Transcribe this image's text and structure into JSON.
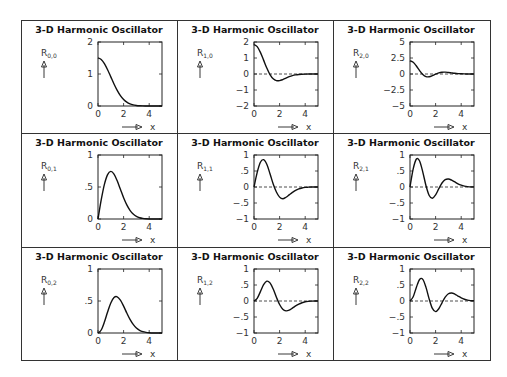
{
  "page": {
    "background": "#ffffff",
    "line_color": "#222222"
  },
  "grid": {
    "rows": 3,
    "cols": 3
  },
  "chart_data": [
    {
      "type": "line",
      "panel": "R_{0,0}",
      "title": "3-D Harmonic Oscillator",
      "ylabel": "R",
      "ysub": "0,0",
      "xlabel": "x",
      "ylim": [
        0,
        2
      ],
      "yticks": [
        0,
        1,
        2
      ],
      "ytick_labels": [
        "0",
        "1",
        "2"
      ],
      "xlim": [
        0,
        5
      ],
      "xticks": [
        0,
        2,
        4
      ],
      "xtick_labels": [
        "0",
        "2",
        "4"
      ],
      "zero_line": false,
      "x": [
        0,
        0.25,
        0.5,
        0.75,
        1,
        1.25,
        1.5,
        1.75,
        2,
        2.25,
        2.5,
        2.75,
        3,
        3.25,
        3.5,
        3.75,
        4,
        4.25,
        4.5,
        4.75,
        5
      ],
      "values": [
        1.502,
        1.456,
        1.326,
        1.134,
        0.911,
        0.688,
        0.488,
        0.325,
        0.203,
        0.12,
        0.066,
        0.034,
        0.017,
        0.008,
        0.003,
        0.001,
        0,
        0,
        0,
        0,
        0
      ]
    },
    {
      "type": "line",
      "panel": "R_{1,0}",
      "title": "3-D Harmonic Oscillator",
      "ylabel": "R",
      "ysub": "1,0",
      "xlabel": "x",
      "ylim": [
        -2,
        2
      ],
      "yticks": [
        -2,
        -1,
        0,
        1,
        2
      ],
      "ytick_labels": [
        "−2",
        "−1",
        "0",
        "1",
        "2"
      ],
      "xlim": [
        0,
        5
      ],
      "xticks": [
        0,
        2,
        4
      ],
      "xtick_labels": [
        "0",
        "2",
        "4"
      ],
      "zero_line": true,
      "x": [
        0,
        0.25,
        0.5,
        0.75,
        1,
        1.25,
        1.5,
        1.75,
        2,
        2.25,
        2.5,
        2.75,
        3,
        3.25,
        3.5,
        3.75,
        4,
        4.25,
        4.5,
        4.75,
        5
      ],
      "values": [
        1.84,
        1.708,
        1.353,
        0.868,
        0.372,
        -0.035,
        -0.299,
        -0.415,
        -0.415,
        -0.347,
        -0.256,
        -0.17,
        -0.102,
        -0.057,
        -0.029,
        -0.014,
        -0.006,
        0,
        0,
        0,
        0
      ]
    },
    {
      "type": "line",
      "panel": "R_{2,0}",
      "title": "3-D Harmonic Oscillator",
      "ylabel": "R",
      "ysub": "2,0",
      "xlabel": "x",
      "ylim": [
        -5,
        5
      ],
      "yticks": [
        -5,
        -2.5,
        0,
        2.5,
        5
      ],
      "ytick_labels": [
        "−5",
        "−2.5",
        "0",
        "2.5",
        "5"
      ],
      "xlim": [
        0,
        5
      ],
      "xticks": [
        0,
        2,
        4
      ],
      "xtick_labels": [
        "0",
        "2",
        "4"
      ],
      "zero_line": true,
      "x": [
        0,
        0.25,
        0.5,
        0.75,
        1,
        1.25,
        1.5,
        1.75,
        2,
        2.25,
        2.5,
        2.75,
        3,
        3.25,
        3.5,
        3.75,
        4,
        4.25,
        4.5,
        4.75,
        5
      ],
      "values": [
        2.063,
        1.834,
        1.244,
        0.521,
        -0.083,
        -0.408,
        -0.435,
        -0.26,
        -0.019,
        0.178,
        0.279,
        0.29,
        0.243,
        0.175,
        0.112,
        0.065,
        0.033,
        0.015,
        0.006,
        0.002,
        0
      ]
    },
    {
      "type": "line",
      "panel": "R_{0,1}",
      "title": "3-D Harmonic Oscillator",
      "ylabel": "R",
      "ysub": "0,1",
      "xlabel": "x",
      "ylim": [
        0,
        1
      ],
      "yticks": [
        0,
        0.5,
        1
      ],
      "ytick_labels": [
        "0",
        ".5",
        "1"
      ],
      "xlim": [
        0,
        5
      ],
      "xticks": [
        0,
        2,
        4
      ],
      "xtick_labels": [
        "0",
        "2",
        "4"
      ],
      "zero_line": false,
      "x": [
        0,
        0.25,
        0.5,
        0.75,
        1,
        1.25,
        1.5,
        1.75,
        2,
        2.25,
        2.5,
        2.75,
        3,
        3.25,
        3.5,
        3.75,
        4,
        4.25,
        4.5,
        4.75,
        5
      ],
      "values": [
        0,
        0.297,
        0.541,
        0.694,
        0.744,
        0.702,
        0.597,
        0.464,
        0.332,
        0.22,
        0.135,
        0.077,
        0.041,
        0.02,
        0.009,
        0.004,
        0.001,
        0,
        0,
        0,
        0
      ]
    },
    {
      "type": "line",
      "panel": "R_{1,1}",
      "title": "3-D Harmonic Oscillator",
      "ylabel": "R",
      "ysub": "1,1",
      "xlabel": "x",
      "ylim": [
        -1,
        1
      ],
      "yticks": [
        -1,
        -0.5,
        0,
        0.5,
        1
      ],
      "ytick_labels": [
        "−1",
        "−.5",
        "0",
        ".5",
        "1"
      ],
      "xlim": [
        0,
        5
      ],
      "xticks": [
        0,
        2,
        4
      ],
      "xtick_labels": [
        "0",
        "2",
        "4"
      ],
      "zero_line": true,
      "x": [
        0,
        0.25,
        0.5,
        0.75,
        1,
        1.25,
        1.5,
        1.75,
        2,
        2.25,
        2.5,
        2.75,
        3,
        3.25,
        3.5,
        3.75,
        4,
        4.25,
        4.5,
        4.75,
        5
      ],
      "values": [
        0,
        0.457,
        0.774,
        0.854,
        0.71,
        0.414,
        0.095,
        -0.156,
        -0.317,
        -0.369,
        -0.321,
        -0.245,
        -0.169,
        -0.104,
        -0.059,
        -0.03,
        -0.013,
        -0.005,
        0,
        0,
        0
      ]
    },
    {
      "type": "line",
      "panel": "R_{2,1}",
      "title": "3-D Harmonic Oscillator",
      "ylabel": "R",
      "ysub": "2,1",
      "xlabel": "x",
      "ylim": [
        -1,
        1
      ],
      "yticks": [
        -1,
        -0.5,
        0,
        0.5,
        1
      ],
      "ytick_labels": [
        "−1",
        "−.5",
        "0",
        ".5",
        "1"
      ],
      "xlim": [
        0,
        5
      ],
      "xticks": [
        0,
        2,
        4
      ],
      "xtick_labels": [
        "0",
        "2",
        "4"
      ],
      "zero_line": true,
      "x": [
        0,
        0.25,
        0.5,
        0.75,
        1,
        1.25,
        1.5,
        1.75,
        2,
        2.25,
        2.5,
        2.75,
        3,
        3.25,
        3.5,
        3.75,
        4,
        4.25,
        4.5,
        4.75,
        5
      ],
      "values": [
        0,
        0.564,
        0.873,
        0.813,
        0.467,
        0.041,
        -0.264,
        -0.351,
        -0.246,
        -0.053,
        0.125,
        0.228,
        0.249,
        0.215,
        0.158,
        0.1,
        0.057,
        0.029,
        0.013,
        0.005,
        0.002
      ]
    },
    {
      "type": "line",
      "panel": "R_{0,2}",
      "title": "3-D Harmonic Oscillator",
      "ylabel": "R",
      "ysub": "0,2",
      "xlabel": "x",
      "ylim": [
        0,
        1
      ],
      "yticks": [
        0,
        0.5,
        1
      ],
      "ytick_labels": [
        "0",
        ".5",
        "1"
      ],
      "xlim": [
        0,
        5
      ],
      "xticks": [
        0,
        2,
        4
      ],
      "xtick_labels": [
        "0",
        "2",
        "4"
      ],
      "zero_line": false,
      "x": [
        0,
        0.25,
        0.5,
        0.75,
        1,
        1.25,
        1.5,
        1.75,
        2,
        2.25,
        2.5,
        2.75,
        3,
        3.25,
        3.5,
        3.75,
        4,
        4.25,
        4.5,
        4.75,
        5
      ],
      "values": [
        0,
        0.047,
        0.171,
        0.329,
        0.47,
        0.554,
        0.566,
        0.513,
        0.42,
        0.312,
        0.213,
        0.134,
        0.077,
        0.042,
        0.021,
        0.01,
        0.004,
        0,
        0,
        0,
        0
      ]
    },
    {
      "type": "line",
      "panel": "R_{1,2}",
      "title": "3-D Harmonic Oscillator",
      "ylabel": "R",
      "ysub": "1,2",
      "xlabel": "x",
      "ylim": [
        -1,
        1
      ],
      "yticks": [
        -1,
        -0.5,
        0,
        0.5,
        1
      ],
      "ytick_labels": [
        "−1",
        "−.5",
        "0",
        ".5",
        "1"
      ],
      "xlim": [
        0,
        5
      ],
      "xticks": [
        0,
        2,
        4
      ],
      "xtick_labels": [
        "0",
        "2",
        "4"
      ],
      "zero_line": true,
      "x": [
        0,
        0.25,
        0.5,
        0.75,
        1,
        1.25,
        1.5,
        1.75,
        2,
        2.25,
        2.5,
        2.75,
        3,
        3.25,
        3.5,
        3.75,
        4,
        4.25,
        4.5,
        4.75,
        5
      ],
      "values": [
        0,
        0.085,
        0.292,
        0.509,
        0.619,
        0.566,
        0.373,
        0.118,
        -0.11,
        -0.257,
        -0.307,
        -0.286,
        -0.224,
        -0.155,
        -0.097,
        -0.054,
        -0.024,
        -0.01,
        -0.003,
        0,
        0
      ]
    },
    {
      "type": "line",
      "panel": "R_{2,2}",
      "title": "3-D Harmonic Oscillator",
      "ylabel": "R",
      "ysub": "2,2",
      "xlabel": "x",
      "ylim": [
        -1,
        1
      ],
      "yticks": [
        -1,
        -0.5,
        0,
        0.5,
        1
      ],
      "ytick_labels": [
        "−1",
        "−.5",
        "0",
        ".5",
        "1"
      ],
      "xlim": [
        0,
        5
      ],
      "xticks": [
        0,
        2,
        4
      ],
      "xtick_labels": [
        "0",
        "2",
        "4"
      ],
      "zero_line": true,
      "x": [
        0,
        0.25,
        0.5,
        0.75,
        1,
        1.25,
        1.5,
        1.75,
        2,
        2.25,
        2.5,
        2.75,
        3,
        3.25,
        3.5,
        3.75,
        4,
        4.25,
        4.5,
        4.75,
        5
      ],
      "values": [
        0,
        0.132,
        0.431,
        0.673,
        0.677,
        0.426,
        0.059,
        -0.232,
        -0.331,
        -0.242,
        -0.056,
        0.121,
        0.227,
        0.251,
        0.216,
        0.155,
        0.098,
        0.054,
        0.026,
        0.012,
        0.005
      ]
    }
  ]
}
